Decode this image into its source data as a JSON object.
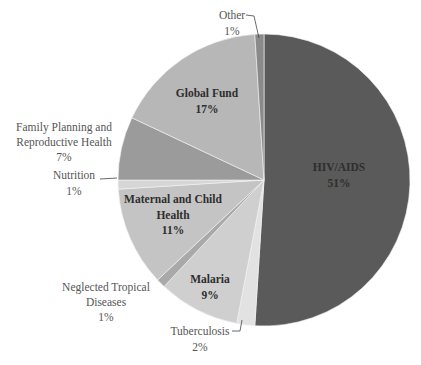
{
  "chart_data": {
    "type": "pie",
    "title": "",
    "start_angle_deg": 0,
    "direction": "clockwise",
    "categories": [
      "HIV/AIDS",
      "Tuberculosis",
      "Malaria",
      "Neglected Tropical Diseases",
      "Maternal and Child Health",
      "Nutrition",
      "Family Planning and Reproductive Health",
      "Global Fund",
      "Other"
    ],
    "values": [
      51,
      2,
      9,
      1,
      11,
      1,
      7,
      17,
      1
    ],
    "labels": [
      "HIV/AIDS\n51%",
      "Tuberculosis\n2%",
      "Malaria\n9%",
      "Neglected Tropical\nDiseases\n1%",
      "Maternal and Child\nHealth\n11%",
      "Nutrition\n1%",
      "Family Planning and\nReproductive Health\n7%",
      "Global Fund\n17%",
      "Other\n1%"
    ],
    "colors": [
      "#5a5a5a",
      "#e2e2e2",
      "#cfcfcf",
      "#a9a9a9",
      "#c4c4c4",
      "#d6d6d6",
      "#9b9b9b",
      "#b7b7b7",
      "#8a8a8a"
    ],
    "legend": "none",
    "unit": "%"
  },
  "labels": {
    "hiv": [
      "HIV/AIDS",
      "51%"
    ],
    "tb": [
      "Tuberculosis",
      "2%"
    ],
    "malaria": [
      "Malaria",
      "9%"
    ],
    "ntd": [
      "Neglected Tropical",
      "Diseases",
      "1%"
    ],
    "mch": [
      "Maternal and Child",
      "Health",
      "11%"
    ],
    "nutrition": [
      "Nutrition",
      "1%"
    ],
    "fp": [
      "Family Planning and",
      "Reproductive Health",
      "7%"
    ],
    "gf": [
      "Global Fund",
      "17%"
    ],
    "other": [
      "Other",
      "1%"
    ]
  }
}
